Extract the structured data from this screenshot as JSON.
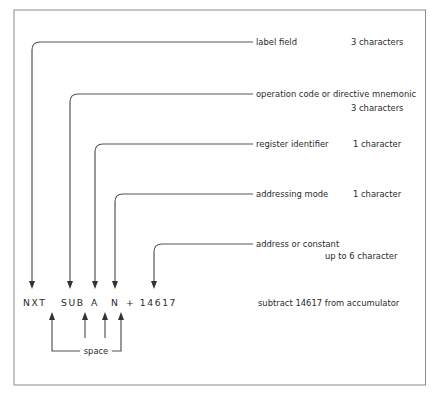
{
  "fields": [
    {
      "name": "label-field",
      "label": "label field",
      "size": "3 characters",
      "line_y": 42,
      "line_x": 32
    },
    {
      "name": "operation-code",
      "label": "operation code or directive mnemonic",
      "size": "3 characters",
      "line_y": 94,
      "line_x": 70
    },
    {
      "name": "register-identifier",
      "label": "register identifier",
      "size": "1 character",
      "line_y": 144,
      "line_x": 95
    },
    {
      "name": "addressing-mode",
      "label": "addressing mode",
      "size": "1 character",
      "line_y": 194,
      "line_x": 115
    },
    {
      "name": "address-or-constant",
      "label": "address or constant",
      "size": "up to  6 character",
      "line_y": 244,
      "line_x": 154
    }
  ],
  "instruction": {
    "label": "NXT",
    "opcode": "SUB",
    "register": "A",
    "mode": "N",
    "operand": "+ 14617",
    "description": "subtract 14617 from accumulator"
  },
  "space_label": "space",
  "colors": {
    "line": "#555555",
    "text": "#2a2a2a",
    "frame": "#8a8a8a",
    "background": "#ffffff"
  }
}
